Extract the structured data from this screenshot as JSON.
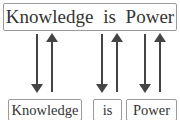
{
  "diagram": {
    "sentence": "Knowledge is Power",
    "tokens": [
      "Knowledge",
      "is",
      "Power"
    ],
    "arrow_pairs": [
      {
        "token": "Knowledge",
        "down": true,
        "up": true
      },
      {
        "token": "is",
        "down": true,
        "up": true
      },
      {
        "token": "Power",
        "down": true,
        "up": true
      }
    ],
    "colors": {
      "arrow": "#444444",
      "border": "#9a9a9a",
      "text": "#333333"
    }
  }
}
